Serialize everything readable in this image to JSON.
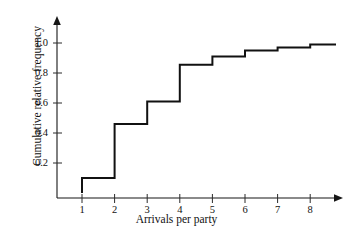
{
  "chart_data": {
    "type": "line",
    "subtype": "step-ecdf",
    "title": "",
    "xlabel": "Arrivals per party",
    "ylabel": "Cumulative relative frequency",
    "x": [
      1,
      2,
      3,
      4,
      5,
      6,
      7,
      8
    ],
    "values": [
      0.1,
      0.46,
      0.61,
      0.855,
      0.91,
      0.95,
      0.97,
      0.99
    ],
    "step_mode": "post",
    "xlim": [
      0,
      9.2
    ],
    "ylim": [
      0,
      1.12
    ],
    "xticks": [
      1,
      2,
      3,
      4,
      5,
      6,
      7,
      8
    ],
    "xtick_labels": [
      "1",
      "2",
      "3",
      "4",
      "5",
      "6",
      "7",
      "8"
    ],
    "yticks": [
      0.2,
      0.4,
      0.6,
      0.8,
      1.0
    ],
    "ytick_labels": [
      "0.2",
      "0.4",
      "0.6",
      "0.8",
      "1.0"
    ],
    "grid": false,
    "legend": null,
    "series_color": "#111111",
    "axis_color": "#161616",
    "background": "#ffffff",
    "annotations": []
  },
  "figure": {
    "x_axis_name": "Arrivals per party",
    "y_axis_name": "Cumulative relative frequency"
  }
}
